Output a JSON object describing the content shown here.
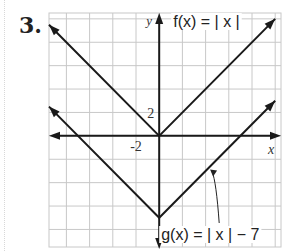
{
  "problem_number": "3.",
  "chart_data": {
    "type": "line",
    "title": "",
    "xlabel": "x",
    "ylabel": "y",
    "xlim": [
      -9.5,
      10.5
    ],
    "ylim": [
      -9.5,
      10.5
    ],
    "grid": true,
    "grid_step": 2,
    "tick_labels": {
      "x": "-2",
      "y": "2"
    },
    "series": [
      {
        "name": "f(x) = | x |",
        "formula": "|x|",
        "points": [
          [
            -10,
            10
          ],
          [
            0,
            0
          ],
          [
            10,
            10
          ]
        ]
      },
      {
        "name": "g(x) = | x | − 7",
        "formula": "|x| - 7",
        "points": [
          [
            -10,
            3
          ],
          [
            0,
            -7
          ],
          [
            10,
            3
          ]
        ]
      }
    ],
    "annotations": [
      {
        "text": "f(x) = | x |",
        "placement": "top, right of y-axis"
      },
      {
        "text": "g(x) = | x | − 7",
        "placement": "bottom-right with arrow pointing to g"
      }
    ]
  },
  "colors": {
    "grid": "#c8c8c8",
    "line": "#1a1a1a"
  }
}
